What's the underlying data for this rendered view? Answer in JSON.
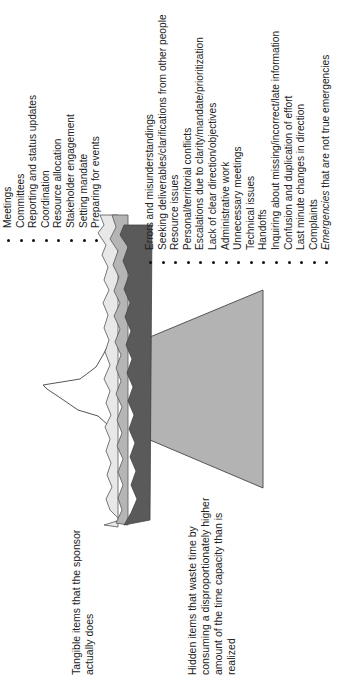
{
  "diagram": {
    "type": "iceberg",
    "orientation": "rotated -90deg",
    "colors": {
      "tip_fill": "#ffffff",
      "band_light": "#e8e8e8",
      "band_mid": "#b5b5b5",
      "band_dark": "#5a5a5a",
      "submerged_fill": "#b3b3b3",
      "outline": "#555555"
    }
  },
  "labels": {
    "tangible": "Tangible items that the sponsor actually does",
    "hidden": "Hidden items that waste time by consuming a disproportionately higher amount of the time capacity than is realized"
  },
  "visible_items": [
    "Meetings",
    "Committees",
    "Reporting and status updates",
    "Coordination",
    "Resource allocation",
    "Stakeholder engagement",
    "Setting mandate",
    "Preparing for events"
  ],
  "hidden_items": [
    "Errors and misunderstandings",
    "Seeking deliverables/clarifications from other people",
    "Resource issues",
    "Personal/territorial conflicts",
    "Escalations due to clarity/mandate/prioritization",
    "Lack of clear direction/objectives",
    "Administrative work",
    "Unnecessary meetings",
    "Technical issues",
    "Handoffs",
    "Inquiring about missing/incorrect/late information",
    "Confusion and duplication of effort",
    "Last minute changes in direction",
    "Complaints"
  ],
  "hidden_last": {
    "emphasis": "Emergencies",
    "rest": " that are not true emergencies"
  }
}
